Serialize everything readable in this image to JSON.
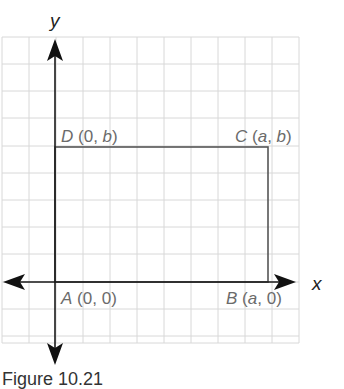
{
  "figure": {
    "caption": "Figure 10.21",
    "axes": {
      "x_label": "x",
      "y_label": "y"
    },
    "grid": {
      "columns": 11,
      "rows": 12,
      "color": "#d8d8d8"
    },
    "shape": "rectangle",
    "points": [
      {
        "name": "A",
        "coords": "(0, 0)",
        "pre": "(0, 0)"
      },
      {
        "name": "B",
        "coords": "(a, 0)"
      },
      {
        "name": "C",
        "coords": "(a, b)"
      },
      {
        "name": "D",
        "coords": "(0, b)"
      }
    ],
    "labels": {
      "A": {
        "letter": "A",
        "open": "(",
        "v1": "0",
        "sep": ", ",
        "v2": "0",
        "close": ")"
      },
      "B": {
        "letter": "B",
        "open": "(",
        "v1": "a",
        "sep": ", ",
        "v2": "0",
        "close": ")"
      },
      "C": {
        "letter": "C",
        "open": "(",
        "v1": "a",
        "sep": ", ",
        "v2": "b",
        "close": ")"
      },
      "D": {
        "letter": "D",
        "open": "(",
        "v1": "0",
        "sep": ", ",
        "v2": "b",
        "close": ")"
      }
    },
    "colors": {
      "axis": "#1a1a1a",
      "rectangle": "#555555",
      "label": "#6b6b6b"
    }
  }
}
